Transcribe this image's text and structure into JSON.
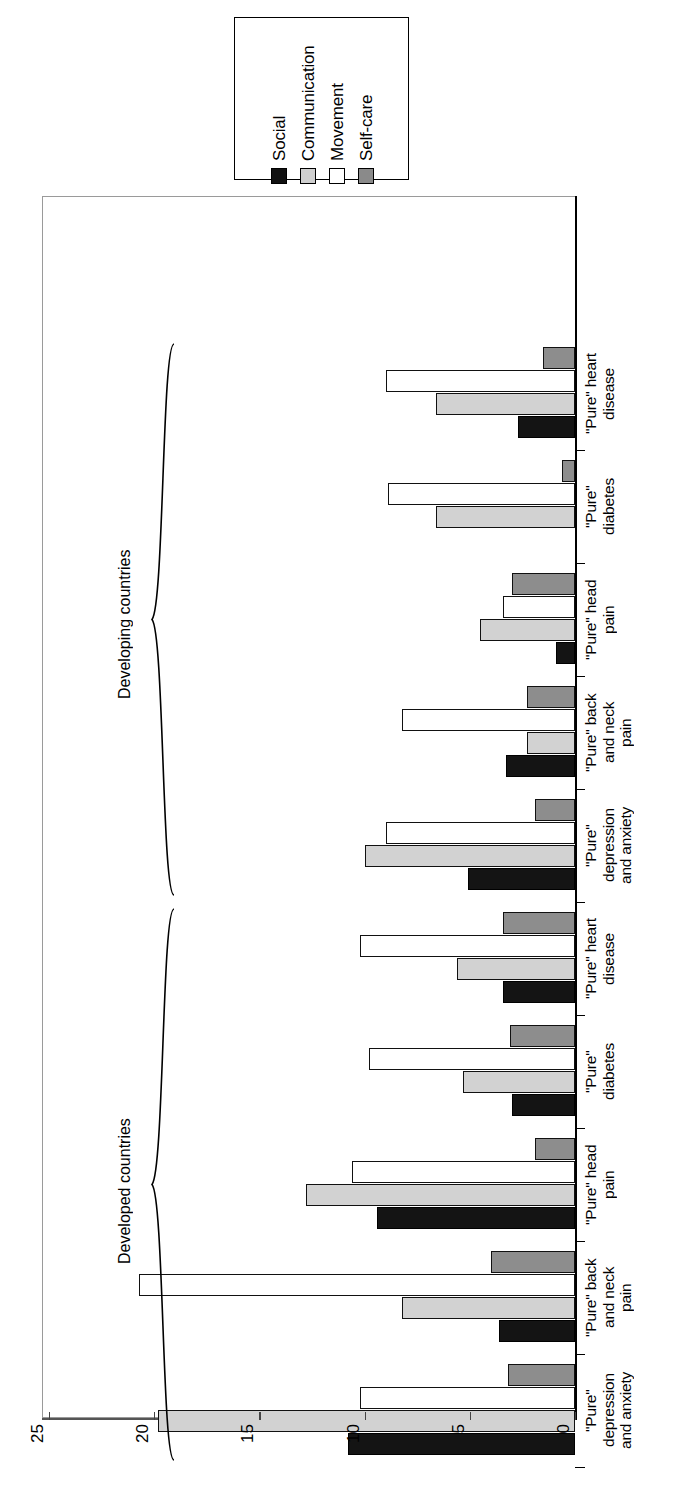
{
  "chart_data": {
    "type": "bar",
    "orientation": "horizontal-rotated",
    "title": "",
    "xlabel": "",
    "ylabel": "",
    "ylim": [
      0,
      25
    ],
    "ticks": [
      "0",
      "5",
      "10",
      "15",
      "20",
      "25"
    ],
    "grid": false,
    "legend_position": "top",
    "legend": [
      "Social",
      "Communication",
      "Movement",
      "Self-care"
    ],
    "series_colors": {
      "Social": "#141414",
      "Communication": "#d2d2d2",
      "Movement": "#ffffff",
      "Self-care": "#8d8d8d"
    },
    "super_groups": [
      {
        "label": "Developed countries",
        "categories": [
          0,
          1,
          2,
          3,
          4
        ]
      },
      {
        "label": "Developing countries",
        "categories": [
          5,
          6,
          7,
          8,
          9
        ]
      }
    ],
    "categories": [
      "\"Pure\"\ndepression\nand anxiety",
      "\"Pure\" back\nand neck\npain",
      "\"Pure\" head\npain",
      "\"Pure\"\ndiabetes",
      "\"Pure\" heart\ndisease",
      "\"Pure\"\ndepression\nand anxiety",
      "\"Pure\" back\nand neck\npain",
      "\"Pure\" head\npain",
      "\"Pure\"\ndiabetes",
      "\"Pure\" heart\ndisease"
    ],
    "series": [
      {
        "name": "Social",
        "values": [
          10.8,
          3.6,
          9.4,
          3.0,
          3.4,
          5.1,
          3.3,
          0.9,
          0.0,
          2.7
        ]
      },
      {
        "name": "Communication",
        "values": [
          19.8,
          8.2,
          12.8,
          5.3,
          5.6,
          10.0,
          2.3,
          4.5,
          6.6,
          6.6
        ]
      },
      {
        "name": "Movement",
        "values": [
          10.2,
          20.7,
          10.6,
          9.8,
          10.2,
          9.0,
          8.2,
          3.4,
          8.9,
          9.0
        ]
      },
      {
        "name": "Self-care",
        "values": [
          3.2,
          4.0,
          1.9,
          3.1,
          3.4,
          1.9,
          2.3,
          3.0,
          0.6,
          1.5
        ]
      }
    ]
  }
}
